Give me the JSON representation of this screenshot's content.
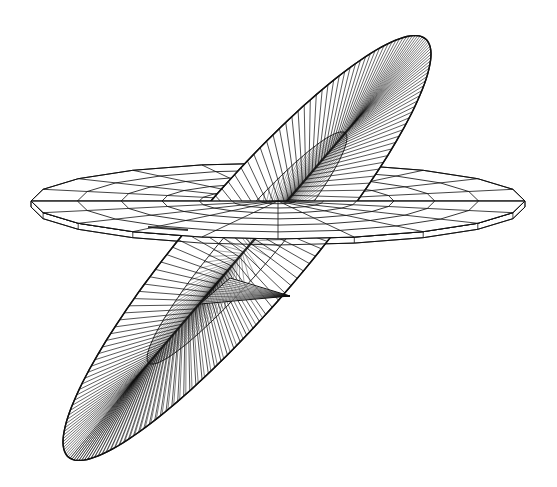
{
  "figure": {
    "description": "Wireframe rendering of a tilted elliptical surface (dense radial hatching converging on a central spine) intersecting a horizontal polar-grid disc",
    "background": "#ffffff",
    "stroke_color": "#111111"
  },
  "horizontal_disc": {
    "center": [
      278,
      201
    ],
    "rx": 247,
    "ry": 38,
    "rim_thickness": 6,
    "sides": 20,
    "rings": 7,
    "spokes": 20
  },
  "tilted_ellipse": {
    "center": [
      247,
      248
    ],
    "semi_major": 275,
    "semi_minor": 58,
    "angle_deg": -49.5,
    "hatch_lines": 180,
    "inner_ellipse": {
      "scale_major": 0.55,
      "scale_minor": 0.42
    }
  },
  "fin": {
    "points": [
      [
        200,
        304
      ],
      [
        290,
        296
      ],
      [
        230,
        278
      ]
    ]
  }
}
